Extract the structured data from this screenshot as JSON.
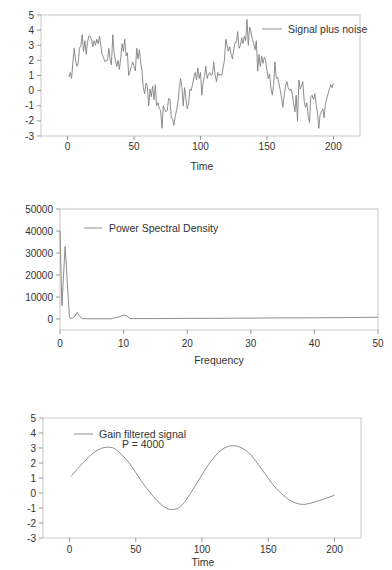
{
  "chart_data": [
    {
      "id": "signal",
      "type": "line",
      "title": "",
      "xlabel": "Time",
      "ylabel": "",
      "xlim": [
        -20,
        220
      ],
      "ylim": [
        -3,
        5
      ],
      "xticks": [
        0,
        50,
        100,
        150,
        200
      ],
      "yticks": [
        -3,
        -2,
        -1,
        0,
        1,
        2,
        3,
        4,
        5
      ],
      "grid": false,
      "legend": {
        "entries": [
          "Signal plus noise"
        ],
        "position": "upper right"
      },
      "series": [
        {
          "name": "Signal plus noise",
          "x": [
            1,
            2,
            3,
            4,
            5,
            6,
            7,
            8,
            9,
            10,
            11,
            12,
            13,
            14,
            15,
            16,
            17,
            18,
            19,
            20,
            21,
            22,
            23,
            24,
            25,
            26,
            27,
            28,
            29,
            30,
            31,
            32,
            33,
            34,
            35,
            36,
            37,
            38,
            39,
            40,
            41,
            42,
            43,
            44,
            45,
            46,
            47,
            48,
            49,
            50,
            51,
            52,
            53,
            54,
            55,
            56,
            57,
            58,
            59,
            60,
            61,
            62,
            63,
            64,
            65,
            66,
            67,
            68,
            69,
            70,
            71,
            72,
            73,
            74,
            75,
            76,
            77,
            78,
            79,
            80,
            81,
            82,
            83,
            84,
            85,
            86,
            87,
            88,
            89,
            90,
            91,
            92,
            93,
            94,
            95,
            96,
            97,
            98,
            99,
            100,
            101,
            102,
            103,
            104,
            105,
            106,
            107,
            108,
            109,
            110,
            111,
            112,
            113,
            114,
            115,
            116,
            117,
            118,
            119,
            120,
            121,
            122,
            123,
            124,
            125,
            126,
            127,
            128,
            129,
            130,
            131,
            132,
            133,
            134,
            135,
            136,
            137,
            138,
            139,
            140,
            141,
            142,
            143,
            144,
            145,
            146,
            147,
            148,
            149,
            150,
            151,
            152,
            153,
            154,
            155,
            156,
            157,
            158,
            159,
            160,
            161,
            162,
            163,
            164,
            165,
            166,
            167,
            168,
            169,
            170,
            171,
            172,
            173,
            174,
            175,
            176,
            177,
            178,
            179,
            180,
            181,
            182,
            183,
            184,
            185,
            186,
            187,
            188,
            189,
            190,
            191,
            192,
            193,
            194,
            195,
            196,
            197,
            198,
            199,
            200
          ],
          "y": [
            0.9,
            1.2,
            0.8,
            1.9,
            2.8,
            2.0,
            1.6,
            1.8,
            2.8,
            3.0,
            3.7,
            2.6,
            3.3,
            2.4,
            3.2,
            3.6,
            3.6,
            3.4,
            2.9,
            3.3,
            3.0,
            3.4,
            3.1,
            3.6,
            3.0,
            2.4,
            2.2,
            1.9,
            2.0,
            2.0,
            2.8,
            2.1,
            1.7,
            3.7,
            2.5,
            2.0,
            1.6,
            2.0,
            1.4,
            2.2,
            3.1,
            2.6,
            3.4,
            2.3,
            2.5,
            1.0,
            1.3,
            1.6,
            1.9,
            1.6,
            1.3,
            2.8,
            2.1,
            2.7,
            1.9,
            1.3,
            0.2,
            -0.2,
            0.5,
            0.3,
            -1.0,
            0.1,
            -0.4,
            0.3,
            -0.6,
            0.4,
            -1.0,
            -0.8,
            -1.2,
            -1.3,
            -2.5,
            -1.0,
            -1.2,
            -1.4,
            -1.3,
            -0.5,
            -0.6,
            -1.8,
            -1.9,
            -2.3,
            -1.7,
            -1.3,
            -0.8,
            0.1,
            0.8,
            0.2,
            -1.0,
            0.2,
            -0.5,
            -1.2,
            -0.9,
            0.1,
            0.0,
            0.4,
            0.9,
            1.2,
            0.7,
            1.5,
            0.8,
            1.2,
            -0.3,
            0.6,
            1.0,
            1.6,
            0.8,
            1.1,
            1.2,
            1.0,
            1.1,
            1.9,
            1.0,
            0.6,
            1.2,
            1.0,
            1.1,
            1.0,
            1.5,
            2.0,
            3.4,
            3.0,
            2.6,
            2.9,
            2.4,
            2.1,
            2.7,
            3.2,
            3.2,
            3.9,
            2.8,
            3.0,
            3.5,
            3.1,
            3.6,
            3.3,
            4.7,
            3.0,
            4.2,
            3.9,
            3.4,
            3.1,
            2.7,
            3.3,
            1.3,
            2.4,
            1.6,
            2.3,
            1.8,
            2.2,
            2.0,
            1.3,
            0.8,
            1.1,
            0.2,
            -0.3,
            0.4,
            1.9,
            0.8,
            0.9,
            0.5,
            0.0,
            -0.5,
            -1.1,
            -0.3,
            0.3,
            0.6,
            0.2,
            0.0,
            0.1,
            -0.2,
            -0.8,
            -1.4,
            -0.3,
            -2.0,
            0.7,
            0.1,
            0.3,
            0.6,
            -0.7,
            -1.1,
            -0.8,
            -1.7,
            -2.1,
            -0.4,
            -0.3,
            -0.6,
            -0.2,
            -0.9,
            -1.5,
            -2.5,
            -1.6,
            -1.4,
            -1.2,
            -1.8,
            -0.9,
            -0.5,
            -0.2,
            0.1,
            0.4,
            0.2,
            0.5,
            -0.3,
            0.1,
            0.4,
            0.8
          ]
        }
      ]
    },
    {
      "id": "psd",
      "type": "line",
      "title": "",
      "xlabel": "Frequency",
      "ylabel": "",
      "xlim": [
        0,
        50
      ],
      "ylim": [
        -5000,
        50000
      ],
      "xticks": [
        0,
        10,
        20,
        30,
        40,
        50
      ],
      "yticks": [
        0,
        10000,
        20000,
        30000,
        40000,
        50000
      ],
      "grid": false,
      "legend": {
        "entries": [
          "Power Spectral Density"
        ],
        "position": "upper left"
      },
      "series": [
        {
          "name": "Power Spectral Density",
          "x": [
            0,
            0.3,
            0.8,
            1.5,
            1.9,
            2.4,
            2.7,
            3.1,
            3.5,
            5,
            8,
            9.5,
            10,
            10.5,
            11,
            15,
            20,
            25,
            30,
            35,
            40,
            45,
            50
          ],
          "y": [
            40000,
            6000,
            33000,
            500,
            300,
            1500,
            3000,
            1200,
            200,
            100,
            100,
            1200,
            1800,
            1400,
            200,
            200,
            250,
            300,
            400,
            500,
            550,
            650,
            800
          ]
        }
      ]
    },
    {
      "id": "filtered",
      "type": "line",
      "title": "",
      "xlabel": "Time",
      "ylabel": "",
      "xlim": [
        -20,
        220
      ],
      "ylim": [
        -3,
        5
      ],
      "xticks": [
        0,
        50,
        100,
        150,
        200
      ],
      "yticks": [
        -3,
        -2,
        -1,
        0,
        1,
        2,
        3,
        4,
        5
      ],
      "grid": false,
      "legend": {
        "entries": [
          "Gain filtered signal"
        ],
        "annotation": "P = 4000",
        "position": "upper left"
      },
      "series": [
        {
          "name": "Gain filtered signal",
          "x": [
            1,
            10,
            20,
            28,
            35,
            45,
            55,
            65,
            72,
            78,
            85,
            95,
            105,
            115,
            125,
            135,
            145,
            155,
            165,
            172,
            178,
            185,
            192,
            200
          ],
          "y": [
            1.1,
            2.0,
            2.8,
            3.05,
            2.9,
            2.0,
            0.7,
            -0.4,
            -0.95,
            -1.1,
            -0.8,
            0.5,
            1.9,
            2.9,
            3.15,
            2.7,
            1.6,
            0.4,
            -0.4,
            -0.7,
            -0.75,
            -0.6,
            -0.4,
            -0.15
          ]
        }
      ]
    }
  ],
  "labels": {
    "chart1_legend": "Signal plus noise",
    "chart1_xlabel": "Time",
    "chart2_legend": "Power Spectral Density",
    "chart2_xlabel": "Frequency",
    "chart3_legend": "Gain filtered signal",
    "chart3_annotation": "P = 4000",
    "chart3_xlabel": "Time"
  },
  "colors": {
    "series": "#808080",
    "frame": "#c8c8c8",
    "axis": "#9a9a9a",
    "text": "#333333"
  }
}
